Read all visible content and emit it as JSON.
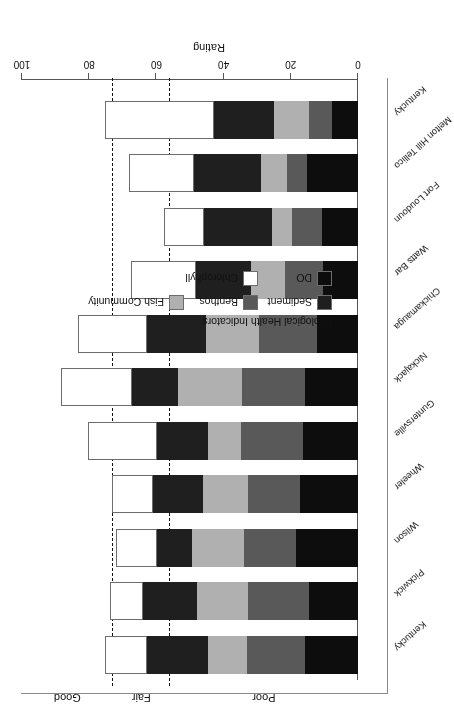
{
  "chart_data": {
    "type": "bar",
    "orientation": "horizontal-stacked",
    "title": "",
    "xlabel": "Rating",
    "ylabel": "",
    "xlim": [
      0,
      100
    ],
    "ticks": [
      0,
      20,
      40,
      60,
      80,
      100
    ],
    "grid": false,
    "legend_title": "Ecological Health Indicators",
    "legend_position": "inside-upper-left",
    "categories": [
      "Kentucky",
      "Pickwick",
      "Wilson",
      "Wheeler",
      "Guntersville",
      "Nickajack",
      "Chickamauga",
      "Watts Bar",
      "Fort Loudoun",
      "Melton Hill Tellico",
      "Kentucky"
    ],
    "series": [
      {
        "name": "DO",
        "color": "#0d0d0d",
        "values": [
          15.8,
          14.6,
          18.5,
          17.3,
          16.4,
          15.8,
          12.2,
          10.4,
          10.7,
          15.2,
          7.7
        ]
      },
      {
        "name": "Benthos",
        "color": "#595959",
        "values": [
          17.3,
          18.2,
          15.5,
          15.5,
          18.5,
          18.8,
          17.3,
          11.3,
          8.9,
          6.0,
          6.8
        ]
      },
      {
        "name": "Fish Community",
        "color": "#b0b0b0",
        "values": [
          11.6,
          15.2,
          15.5,
          13.4,
          9.8,
          19.0,
          15.8,
          10.1,
          6.0,
          7.7,
          10.4
        ]
      },
      {
        "name": "Sediment",
        "color": "#1f1f1f",
        "values": [
          18.2,
          16.1,
          10.4,
          14.9,
          15.2,
          13.7,
          17.6,
          16.4,
          20.2,
          20.0,
          17.9
        ]
      },
      {
        "name": "Chlorophyll",
        "color": "#ffffff",
        "values": [
          12.5,
          9.8,
          12.2,
          12.2,
          20.5,
          21.1,
          20.5,
          19.3,
          11.9,
          19.3,
          32.4
        ]
      }
    ],
    "thresholds": [
      {
        "label": "Poor",
        "value": 0,
        "upper": 56
      },
      {
        "label": "Fair",
        "value": 56,
        "upper": 73
      },
      {
        "label": "Good",
        "value": 73,
        "upper": 100
      }
    ],
    "threshold_lines": [
      56,
      73
    ],
    "zone_labels": [
      "Poor",
      "Fair",
      "Good"
    ]
  },
  "axis": {
    "value_title": "Rating",
    "tick_labels": [
      "0",
      "20",
      "40",
      "60",
      "80",
      "100"
    ]
  },
  "legend": {
    "title": "Ecological Health Indicators",
    "items": [
      {
        "label": "Sediment",
        "color": "#1f1f1f"
      },
      {
        "label": "Benthos",
        "color": "#595959"
      },
      {
        "label": "Fish Community",
        "color": "#b0b0b0"
      },
      {
        "label": "DO",
        "color": "#0d0d0d"
      },
      {
        "label": "Chlorophyll",
        "color": "#ffffff"
      }
    ]
  },
  "zones": {
    "poor": "Poor",
    "fair": "Fair",
    "good": "Good"
  }
}
